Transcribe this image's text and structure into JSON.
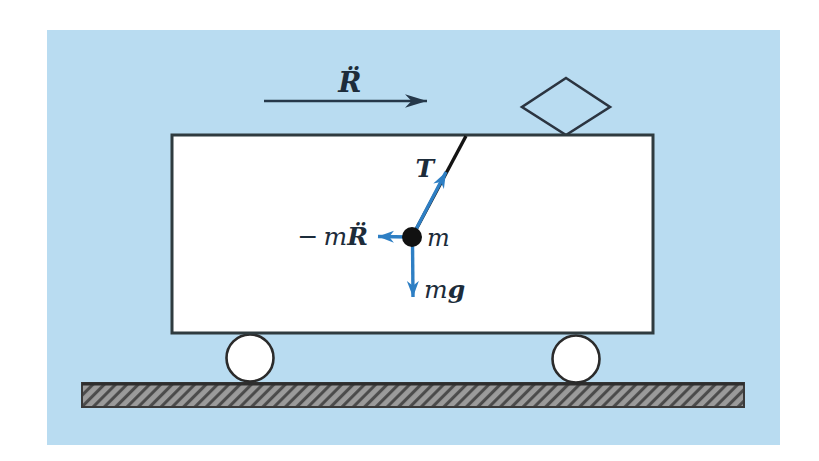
{
  "figure": {
    "type": "physics-free-body-diagram",
    "colors": {
      "background": "#b9dcf1",
      "vector_blue": "#2e7fc4",
      "dark_ink": "#26384a",
      "label_ink": "#1d2c3a",
      "ground_gray": "#9b9b9b",
      "hatch_line": "#4a4a4a",
      "outline": "#2f3b3f",
      "bob_black": "#111111"
    },
    "labels": {
      "acceleration": "R̈",
      "tension": "T",
      "inertial_prefix": "− m",
      "inertial_vector": "R̈",
      "mass": "m",
      "gravity_prefix": "m",
      "gravity_symbol": "g"
    }
  }
}
